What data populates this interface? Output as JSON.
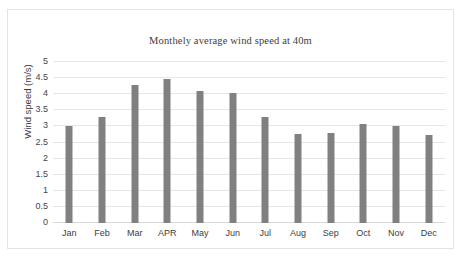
{
  "chart_data": {
    "type": "bar",
    "title": "Monthely average wind speed at 40m",
    "xlabel": "",
    "ylabel": "Wind speed (m/s)",
    "categories": [
      "Jan",
      "Feb",
      "Mar",
      "APR",
      "May",
      "Jun",
      "Jul",
      "Aug",
      "Sep",
      "Oct",
      "Nov",
      "Dec"
    ],
    "values": [
      3.0,
      3.3,
      4.3,
      4.47,
      4.1,
      4.03,
      3.3,
      2.75,
      2.78,
      3.06,
      3.0,
      2.72
    ],
    "ylim": [
      0,
      5
    ],
    "ytick_labels": [
      "0",
      "0.5",
      "1",
      "1.5",
      "2",
      "2.5",
      "3",
      "3.5",
      "4",
      "4.5",
      "5"
    ],
    "ytick_values": [
      0,
      0.5,
      1,
      1.5,
      2,
      2.5,
      3,
      3.5,
      4,
      4.5,
      5
    ],
    "grid": true,
    "legend": false,
    "bar_color": "#808080",
    "gridline_color": "#e6e6e6",
    "border_color": "#e3e3e3"
  }
}
